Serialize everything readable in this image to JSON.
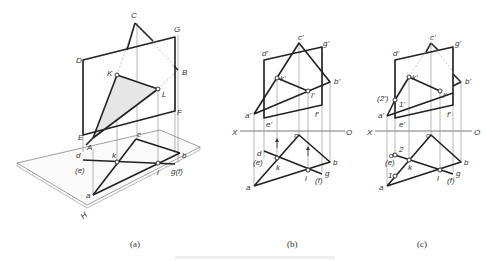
{
  "figure": {
    "captions": [
      "(a)",
      "(b)",
      "(c)"
    ],
    "bottom_caption": ""
  },
  "panel_a": {
    "labels": {
      "C": "C",
      "G": "G",
      "D": "D",
      "K": "K",
      "B": "B",
      "L": "L",
      "F": "F",
      "E": "E",
      "A": "A",
      "c": "c",
      "d": "d",
      "e": "(e)",
      "k": "k",
      "b": "b",
      "l": "l",
      "gf": "g(f)",
      "a": "a",
      "H": "H"
    }
  },
  "panel_b": {
    "labels": {
      "c1": "c'",
      "g1": "g'",
      "d1": "d'",
      "k1": "k'",
      "b1": "b'",
      "l1": "l'",
      "a1": "a'",
      "e1": "e'",
      "f1": "f'",
      "X": "X",
      "O": "O",
      "c": "c",
      "d": "d",
      "e": "(e)",
      "k": "k",
      "b": "b",
      "l": "l",
      "g": "g",
      "f": "(f)",
      "a": "a"
    }
  },
  "panel_c": {
    "labels": {
      "c1": "c'",
      "g1": "g'",
      "d1": "d'",
      "k1": "k'",
      "b1": "b'",
      "l1": "l'",
      "a1": "a'",
      "e1": "e'",
      "f1": "f'",
      "p2": "(2')",
      "p1": "1'",
      "X": "X",
      "O": "O",
      "c": "c",
      "d": "d",
      "e": "(e)",
      "k": "k",
      "b": "b",
      "l": "l",
      "g": "g",
      "f": "(f)",
      "a": "a",
      "n1": "1",
      "n2": "2"
    }
  }
}
